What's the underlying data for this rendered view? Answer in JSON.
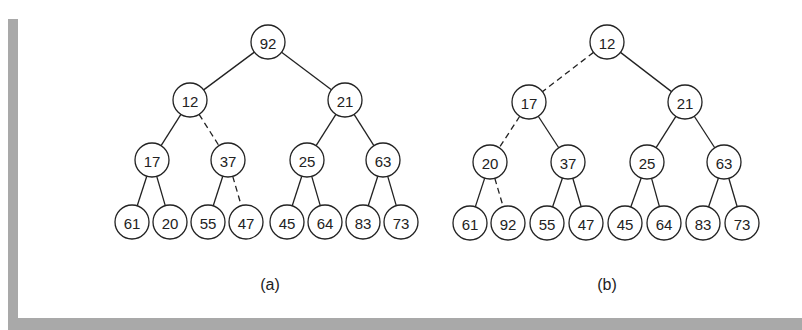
{
  "figure": {
    "trees": [
      {
        "id": "a",
        "caption": "(a)",
        "caption_pos": [
          270,
          286
        ],
        "nodes": [
          {
            "label": "92",
            "x": 268,
            "y": 42
          },
          {
            "label": "12",
            "x": 190,
            "y": 100
          },
          {
            "label": "21",
            "x": 345,
            "y": 100
          },
          {
            "label": "17",
            "x": 152,
            "y": 160
          },
          {
            "label": "37",
            "x": 228,
            "y": 160
          },
          {
            "label": "25",
            "x": 307,
            "y": 160
          },
          {
            "label": "63",
            "x": 383,
            "y": 160
          },
          {
            "label": "61",
            "x": 132,
            "y": 222
          },
          {
            "label": "20",
            "x": 170,
            "y": 222
          },
          {
            "label": "55",
            "x": 208,
            "y": 222
          },
          {
            "label": "47",
            "x": 246,
            "y": 222
          },
          {
            "label": "45",
            "x": 287,
            "y": 222
          },
          {
            "label": "64",
            "x": 325,
            "y": 222
          },
          {
            "label": "83",
            "x": 363,
            "y": 222
          },
          {
            "label": "73",
            "x": 401,
            "y": 222
          }
        ],
        "edges": [
          {
            "from": 0,
            "to": 1,
            "dashed": false
          },
          {
            "from": 0,
            "to": 2,
            "dashed": false
          },
          {
            "from": 1,
            "to": 3,
            "dashed": false
          },
          {
            "from": 1,
            "to": 4,
            "dashed": true
          },
          {
            "from": 2,
            "to": 5,
            "dashed": false
          },
          {
            "from": 2,
            "to": 6,
            "dashed": false
          },
          {
            "from": 3,
            "to": 7,
            "dashed": false
          },
          {
            "from": 3,
            "to": 8,
            "dashed": false
          },
          {
            "from": 4,
            "to": 9,
            "dashed": false
          },
          {
            "from": 4,
            "to": 10,
            "dashed": true
          },
          {
            "from": 5,
            "to": 11,
            "dashed": false
          },
          {
            "from": 5,
            "to": 12,
            "dashed": false
          },
          {
            "from": 6,
            "to": 13,
            "dashed": false
          },
          {
            "from": 6,
            "to": 14,
            "dashed": false
          }
        ]
      },
      {
        "id": "b",
        "caption": "(b)",
        "caption_pos": [
          607,
          286
        ],
        "nodes": [
          {
            "label": "12",
            "x": 607,
            "y": 42
          },
          {
            "label": "17",
            "x": 529,
            "y": 102
          },
          {
            "label": "21",
            "x": 685,
            "y": 102
          },
          {
            "label": "20",
            "x": 490,
            "y": 162
          },
          {
            "label": "37",
            "x": 568,
            "y": 162
          },
          {
            "label": "25",
            "x": 647,
            "y": 162
          },
          {
            "label": "63",
            "x": 724,
            "y": 162
          },
          {
            "label": "61",
            "x": 470,
            "y": 223
          },
          {
            "label": "92",
            "x": 508,
            "y": 223
          },
          {
            "label": "55",
            "x": 547,
            "y": 223
          },
          {
            "label": "47",
            "x": 586,
            "y": 223
          },
          {
            "label": "45",
            "x": 625,
            "y": 223
          },
          {
            "label": "64",
            "x": 664,
            "y": 223
          },
          {
            "label": "83",
            "x": 703,
            "y": 223
          },
          {
            "label": "73",
            "x": 742,
            "y": 223
          }
        ],
        "edges": [
          {
            "from": 0,
            "to": 1,
            "dashed": true
          },
          {
            "from": 0,
            "to": 2,
            "dashed": false
          },
          {
            "from": 1,
            "to": 3,
            "dashed": true
          },
          {
            "from": 1,
            "to": 4,
            "dashed": false
          },
          {
            "from": 2,
            "to": 5,
            "dashed": false
          },
          {
            "from": 2,
            "to": 6,
            "dashed": false
          },
          {
            "from": 3,
            "to": 7,
            "dashed": false
          },
          {
            "from": 3,
            "to": 8,
            "dashed": true
          },
          {
            "from": 4,
            "to": 9,
            "dashed": false
          },
          {
            "from": 4,
            "to": 10,
            "dashed": false
          },
          {
            "from": 5,
            "to": 11,
            "dashed": false
          },
          {
            "from": 5,
            "to": 12,
            "dashed": false
          },
          {
            "from": 6,
            "to": 13,
            "dashed": false
          },
          {
            "from": 6,
            "to": 14,
            "dashed": false
          }
        ]
      }
    ],
    "node_radius": 17,
    "colors": {
      "frame": "#a9a9a9",
      "stroke": "#222222",
      "background": "#ffffff"
    }
  }
}
